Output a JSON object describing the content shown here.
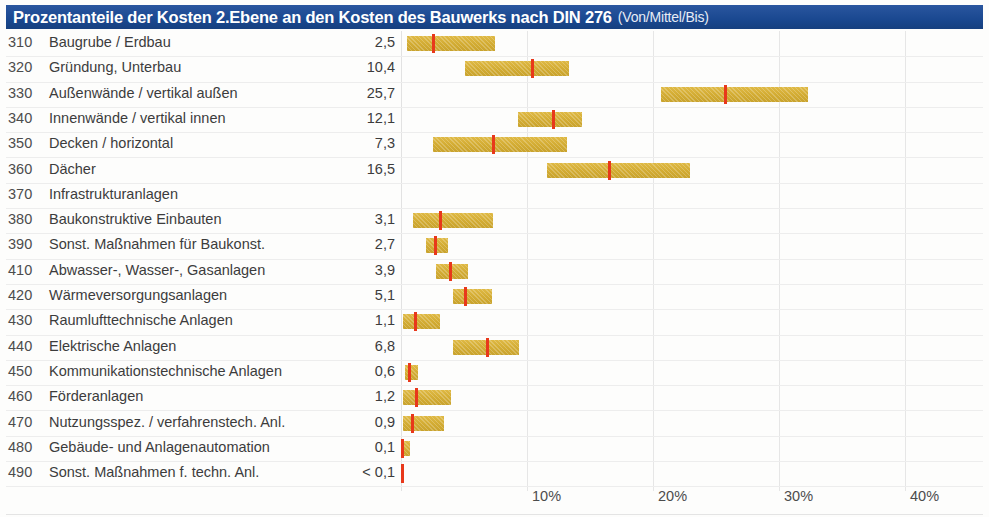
{
  "header": {
    "title": "Prozentanteile der Kosten 2.Ebene an den Kosten des Bauwerks nach DIN 276",
    "subtitle": "(Von/Mittel/Bis)"
  },
  "columns": {
    "code": "Kostengruppe",
    "label": "Bezeichnung",
    "value": "Mittel"
  },
  "axis": {
    "unit": "%",
    "ticks": [
      "10%",
      "20%",
      "30%",
      "40%"
    ],
    "tick_values": [
      10,
      20,
      30,
      40
    ],
    "origin_percent": 0,
    "max_percent": 46
  },
  "colors": {
    "header_background": "#1a4890",
    "header_text": "#ffffff",
    "bar": "#d4ad35",
    "marker": "#e8381b",
    "gridline": "#e6e6e6",
    "text": "#3c3c3c"
  },
  "chart_data": {
    "type": "bar",
    "title": "Prozentanteile der Kosten 2.Ebene an den Kosten des Bauwerks nach DIN 276",
    "subtitle": "(Von/Mittel/Bis)",
    "xlabel": "",
    "ylabel": "",
    "xlim": [
      0,
      46
    ],
    "grid": true,
    "legend": "none",
    "categories": [
      {
        "code": "310",
        "label": "Baugrube / Erdbau",
        "mittel_text": "2,5",
        "von": 0.5,
        "mittel": 2.5,
        "bis": 7.5
      },
      {
        "code": "320",
        "label": "Gründung, Unterbau",
        "mittel_text": "10,4",
        "von": 5.1,
        "mittel": 10.4,
        "bis": 13.3
      },
      {
        "code": "330",
        "label": "Außenwände / vertikal außen",
        "mittel_text": "25,7",
        "von": 20.6,
        "mittel": 25.7,
        "bis": 32.3
      },
      {
        "code": "340",
        "label": "Innenwände / vertikal innen",
        "mittel_text": "12,1",
        "von": 9.3,
        "mittel": 12.1,
        "bis": 14.4
      },
      {
        "code": "350",
        "label": "Decken / horizontal",
        "mittel_text": "7,3",
        "von": 2.5,
        "mittel": 7.3,
        "bis": 13.2
      },
      {
        "code": "360",
        "label": "Dächer",
        "mittel_text": "16,5",
        "von": 11.6,
        "mittel": 16.5,
        "bis": 22.9
      },
      {
        "code": "370",
        "label": "Infrastrukturanlagen",
        "mittel_text": "",
        "von": null,
        "mittel": null,
        "bis": null
      },
      {
        "code": "380",
        "label": "Baukonstruktive Einbauten",
        "mittel_text": "3,1",
        "von": 0.95,
        "mittel": 3.1,
        "bis": 7.3
      },
      {
        "code": "390",
        "label": "Sonst. Maßnahmen für Baukonst.",
        "mittel_text": "2,7",
        "von": 2.0,
        "mittel": 2.7,
        "bis": 3.7
      },
      {
        "code": "410",
        "label": "Abwasser-, Wasser-, Gasanlagen",
        "mittel_text": "3,9",
        "von": 2.8,
        "mittel": 3.9,
        "bis": 5.3
      },
      {
        "code": "420",
        "label": "Wärmeversorgungsanlagen",
        "mittel_text": "5,1",
        "von": 4.1,
        "mittel": 5.1,
        "bis": 7.2
      },
      {
        "code": "430",
        "label": "Raumlufttechnische Anlagen",
        "mittel_text": "1,1",
        "von": 0.15,
        "mittel": 1.1,
        "bis": 3.1
      },
      {
        "code": "440",
        "label": "Elektrische Anlagen",
        "mittel_text": "6,8",
        "von": 4.1,
        "mittel": 6.8,
        "bis": 9.4
      },
      {
        "code": "450",
        "label": "Kommunikationstechnische Anlagen",
        "mittel_text": "0,6",
        "von": 0.3,
        "mittel": 0.6,
        "bis": 1.35
      },
      {
        "code": "460",
        "label": "Förderanlagen",
        "mittel_text": "1,2",
        "von": 0.15,
        "mittel": 1.2,
        "bis": 4.0
      },
      {
        "code": "470",
        "label": "Nutzungsspez. / verfahrenstech. Anl.",
        "mittel_text": "0,9",
        "von": 0.15,
        "mittel": 0.9,
        "bis": 3.4
      },
      {
        "code": "480",
        "label": "Gebäude- und Anlagenautomation",
        "mittel_text": "0,1",
        "von": 0.0,
        "mittel": 0.1,
        "bis": 0.75
      },
      {
        "code": "490",
        "label": "Sonst. Maßnahmen f. techn. Anl.",
        "mittel_text": "< 0,1",
        "von": 0.0,
        "mittel": 0.05,
        "bis": 0.1
      }
    ]
  }
}
